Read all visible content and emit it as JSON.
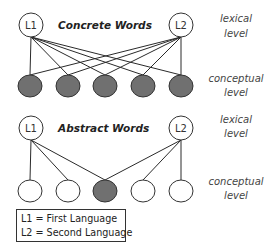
{
  "diagram": {
    "colors": {
      "filled_node": "#707070",
      "empty_node": "#ffffff",
      "stroke": "#333333",
      "line": "#2a2a2a"
    },
    "concrete": {
      "title": "Concrete Words",
      "lexical_nodes": [
        {
          "label": "L1",
          "cx": 31,
          "cy": 25
        },
        {
          "label": "L2",
          "cx": 181,
          "cy": 25
        }
      ],
      "conceptual_nodes": [
        {
          "cx": 30,
          "cy": 86,
          "filled": true
        },
        {
          "cx": 68,
          "cy": 86,
          "filled": true
        },
        {
          "cx": 105,
          "cy": 86,
          "filled": true
        },
        {
          "cx": 143,
          "cy": 86,
          "filled": true
        },
        {
          "cx": 181,
          "cy": 86,
          "filled": true
        }
      ],
      "connections": {
        "L1": [
          0,
          1,
          2,
          3,
          4
        ],
        "L2": [
          0,
          1,
          2,
          3,
          4
        ]
      }
    },
    "abstract": {
      "title": "Abstract Words",
      "lexical_nodes": [
        {
          "label": "L1",
          "cx": 31,
          "cy": 128
        },
        {
          "label": "L2",
          "cx": 181,
          "cy": 128
        }
      ],
      "conceptual_nodes": [
        {
          "cx": 30,
          "cy": 191,
          "filled": false
        },
        {
          "cx": 68,
          "cy": 191,
          "filled": false
        },
        {
          "cx": 105,
          "cy": 191,
          "filled": true
        },
        {
          "cx": 143,
          "cy": 191,
          "filled": false
        },
        {
          "cx": 181,
          "cy": 191,
          "filled": false
        }
      ],
      "connections": {
        "L1": [
          0,
          1,
          2
        ],
        "L2": [
          2,
          3,
          4
        ]
      }
    },
    "level_labels": {
      "lexical_line1": "lexical",
      "lexical_line2": "level",
      "conceptual_line1": "conceptual",
      "conceptual_line2": "level"
    },
    "legend": {
      "items": [
        "L1 = First Language",
        "L2 = Second Language"
      ]
    }
  }
}
